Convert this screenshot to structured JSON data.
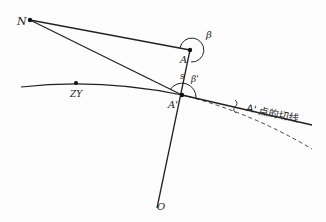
{
  "diagram": {
    "type": "geometry",
    "labels": {
      "N": "N",
      "A": "A",
      "A_prime": "A'",
      "ZY": "ZY",
      "O": "O",
      "s": "s",
      "beta": "β",
      "beta_prime": "β'",
      "tangent": "A' 点的切线"
    },
    "points": {
      "N": [
        30,
        20
      ],
      "A": [
        190,
        50
      ],
      "A_prime": [
        182,
        95
      ],
      "ZY": [
        76,
        83
      ],
      "O": [
        157,
        208
      ]
    },
    "colors": {
      "stroke": "#222222",
      "background": "#fdfdfd"
    }
  }
}
